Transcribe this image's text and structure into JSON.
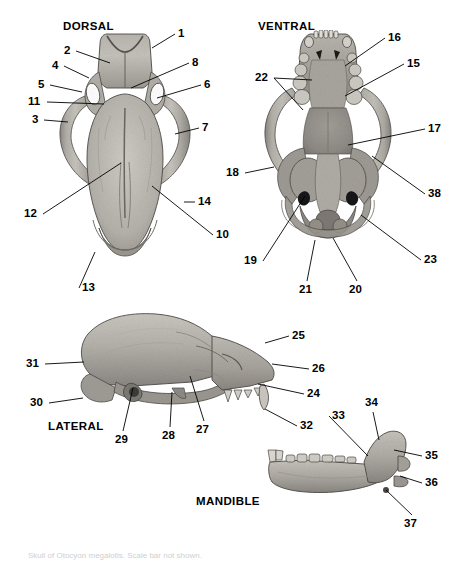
{
  "figure": {
    "kind": "anatomical-plate",
    "background_color": "#ffffff",
    "label_color": "#000000",
    "bone_color_light": "#c9c6c0",
    "bone_color_mid": "#a09c95",
    "bone_color_dark": "#6f6b66",
    "caption_text": "Skull of Otocyon megalotis. Scale bar not shown."
  },
  "views": [
    {
      "id": "dorsal",
      "title": "DORSAL",
      "title_x": 63,
      "title_y": 20
    },
    {
      "id": "ventral",
      "title": "VENTRAL",
      "title_x": 258,
      "title_y": 20
    },
    {
      "id": "lateral",
      "title": "LATERAL",
      "title_x": 48,
      "title_y": 420
    },
    {
      "id": "mandible",
      "title": "MANDIBLE",
      "title_x": 196,
      "title_y": 495
    }
  ],
  "labels": [
    {
      "n": "1",
      "view": "dorsal",
      "x": 178,
      "y": 28,
      "anchor": "left",
      "tip_x": 152,
      "tip_y": 48
    },
    {
      "n": "2",
      "view": "dorsal",
      "x": 64,
      "y": 45,
      "anchor": "right",
      "tip_x": 110,
      "tip_y": 63
    },
    {
      "n": "4",
      "view": "dorsal",
      "x": 52,
      "y": 60,
      "anchor": "right",
      "tip_x": 89,
      "tip_y": 78
    },
    {
      "n": "5",
      "view": "dorsal",
      "x": 38,
      "y": 79,
      "anchor": "right",
      "tip_x": 82,
      "tip_y": 92
    },
    {
      "n": "11",
      "view": "dorsal",
      "x": 28,
      "y": 96,
      "anchor": "right",
      "tip_x": 104,
      "tip_y": 104
    },
    {
      "n": "3",
      "view": "dorsal",
      "x": 32,
      "y": 114,
      "anchor": "right",
      "tip_x": 68,
      "tip_y": 122
    },
    {
      "n": "8",
      "view": "dorsal",
      "x": 192,
      "y": 57,
      "anchor": "left",
      "tip_x": 131,
      "tip_y": 88
    },
    {
      "n": "6",
      "view": "dorsal",
      "x": 204,
      "y": 79,
      "anchor": "left",
      "tip_x": 157,
      "tip_y": 98
    },
    {
      "n": "7",
      "view": "dorsal",
      "x": 202,
      "y": 122,
      "anchor": "left",
      "tip_x": 175,
      "tip_y": 134
    },
    {
      "n": "12",
      "view": "dorsal",
      "x": 24,
      "y": 208,
      "anchor": "right",
      "tip_x": 121,
      "tip_y": 163
    },
    {
      "n": "14",
      "view": "dorsal",
      "x": 198,
      "y": 196,
      "anchor": "left",
      "tip_x": 184,
      "tip_y": 202
    },
    {
      "n": "10",
      "view": "dorsal",
      "x": 216,
      "y": 229,
      "anchor": "left",
      "tip_x": 152,
      "tip_y": 186
    },
    {
      "n": "13",
      "view": "dorsal",
      "x": 82,
      "y": 282,
      "anchor": "left",
      "tip_x": 95,
      "tip_y": 252
    },
    {
      "n": "16",
      "view": "ventral",
      "x": 388,
      "y": 32,
      "anchor": "left",
      "tip_x": 345,
      "tip_y": 66
    },
    {
      "n": "15",
      "view": "ventral",
      "x": 407,
      "y": 58,
      "anchor": "left",
      "tip_x": 345,
      "tip_y": 96
    },
    {
      "n": "22",
      "view": "ventral",
      "x": 255,
      "y": 72,
      "anchor": "right",
      "tip_x": 303,
      "tip_y": 110
    },
    {
      "n": "22b",
      "view": "ventral",
      "x": 255,
      "y": 72,
      "anchor": "right",
      "tip_x": 312,
      "tip_y": 80
    },
    {
      "n": "17",
      "view": "ventral",
      "x": 428,
      "y": 123,
      "anchor": "left",
      "tip_x": 348,
      "tip_y": 145
    },
    {
      "n": "38",
      "view": "ventral",
      "x": 428,
      "y": 188,
      "anchor": "left",
      "tip_x": 372,
      "tip_y": 156
    },
    {
      "n": "18",
      "view": "ventral",
      "x": 226,
      "y": 167,
      "anchor": "right",
      "tip_x": 274,
      "tip_y": 167
    },
    {
      "n": "19",
      "view": "ventral",
      "x": 244,
      "y": 255,
      "anchor": "right",
      "tip_x": 305,
      "tip_y": 196
    },
    {
      "n": "21",
      "view": "ventral",
      "x": 299,
      "y": 284,
      "anchor": "up",
      "tip_x": 315,
      "tip_y": 240
    },
    {
      "n": "20",
      "view": "ventral",
      "x": 349,
      "y": 284,
      "anchor": "up",
      "tip_x": 333,
      "tip_y": 238
    },
    {
      "n": "23",
      "view": "ventral",
      "x": 424,
      "y": 254,
      "anchor": "left",
      "tip_x": 361,
      "tip_y": 215
    },
    {
      "n": "31",
      "view": "lateral",
      "x": 26,
      "y": 358,
      "anchor": "right",
      "tip_x": 84,
      "tip_y": 362
    },
    {
      "n": "30",
      "view": "lateral",
      "x": 30,
      "y": 397,
      "anchor": "right",
      "tip_x": 83,
      "tip_y": 398
    },
    {
      "n": "29",
      "view": "lateral",
      "x": 115,
      "y": 434,
      "anchor": "up",
      "tip_x": 133,
      "tip_y": 388
    },
    {
      "n": "28",
      "view": "lateral",
      "x": 162,
      "y": 430,
      "anchor": "up",
      "tip_x": 172,
      "tip_y": 392
    },
    {
      "n": "27",
      "view": "lateral",
      "x": 196,
      "y": 424,
      "anchor": "up",
      "tip_x": 190,
      "tip_y": 376
    },
    {
      "n": "25",
      "view": "lateral",
      "x": 292,
      "y": 330,
      "anchor": "left",
      "tip_x": 265,
      "tip_y": 343
    },
    {
      "n": "26",
      "view": "lateral",
      "x": 312,
      "y": 363,
      "anchor": "left",
      "tip_x": 272,
      "tip_y": 364
    },
    {
      "n": "24",
      "view": "lateral",
      "x": 307,
      "y": 388,
      "anchor": "left",
      "tip_x": 258,
      "tip_y": 384
    },
    {
      "n": "32",
      "view": "lateral",
      "x": 300,
      "y": 420,
      "anchor": "left",
      "tip_x": 265,
      "tip_y": 409
    },
    {
      "n": "33",
      "view": "mandible",
      "x": 332,
      "y": 410,
      "anchor": "left",
      "tip_x": 368,
      "tip_y": 456
    },
    {
      "n": "34",
      "view": "mandible",
      "x": 365,
      "y": 397,
      "anchor": "down",
      "tip_x": 379,
      "tip_y": 440
    },
    {
      "n": "35",
      "view": "mandible",
      "x": 425,
      "y": 450,
      "anchor": "left",
      "tip_x": 394,
      "tip_y": 450
    },
    {
      "n": "36",
      "view": "mandible",
      "x": 425,
      "y": 477,
      "anchor": "left",
      "tip_x": 400,
      "tip_y": 476
    },
    {
      "n": "37",
      "view": "mandible",
      "x": 404,
      "y": 518,
      "anchor": "up",
      "tip_x": 386,
      "tip_y": 490
    }
  ]
}
